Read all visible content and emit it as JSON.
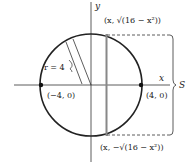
{
  "diagram": {
    "type": "circle-cross-section",
    "axes": {
      "x_label": "x",
      "y_label": "y"
    },
    "circle": {
      "radius_label": "r = 4",
      "radius": 4,
      "center": [
        0,
        0
      ]
    },
    "points": [
      {
        "label": "(−4, 0)",
        "coords": [
          -4,
          0
        ]
      },
      {
        "label": "(4, 0)",
        "coords": [
          4,
          0
        ]
      }
    ],
    "top_point_label": "(x, √(16 − x²))",
    "bottom_point_label": "(x, −√(16 − x²))",
    "side_label": "S",
    "colors": {
      "stroke": "#222222",
      "slice": "#888888"
    }
  }
}
